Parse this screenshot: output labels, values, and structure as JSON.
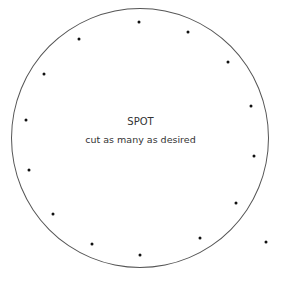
{
  "diagram": {
    "title": "SPOT",
    "subtitle": "cut as many as desired",
    "circle": {
      "cx": 140,
      "cy": 138,
      "rx": 129,
      "ry": 130,
      "stroke": "#555555"
    },
    "dot_color": "#111111",
    "dots": [
      {
        "x": 139,
        "y": 22
      },
      {
        "x": 188,
        "y": 32
      },
      {
        "x": 79,
        "y": 39
      },
      {
        "x": 228,
        "y": 62
      },
      {
        "x": 44,
        "y": 74
      },
      {
        "x": 251,
        "y": 106
      },
      {
        "x": 26,
        "y": 120
      },
      {
        "x": 254,
        "y": 156
      },
      {
        "x": 29,
        "y": 170
      },
      {
        "x": 236,
        "y": 203
      },
      {
        "x": 53,
        "y": 214
      },
      {
        "x": 200,
        "y": 238
      },
      {
        "x": 266,
        "y": 242
      },
      {
        "x": 92,
        "y": 244
      },
      {
        "x": 140,
        "y": 255
      }
    ]
  }
}
